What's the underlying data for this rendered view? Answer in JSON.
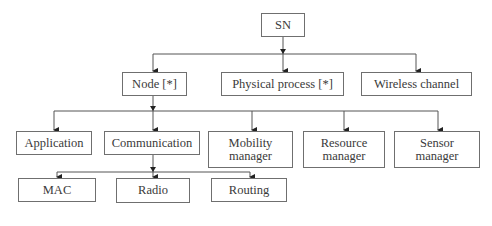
{
  "diagram": {
    "root": {
      "label": "SN"
    },
    "level1": [
      {
        "label": "Node [*]"
      },
      {
        "label": "Physical process [*]"
      },
      {
        "label": "Wireless channel"
      }
    ],
    "node_children": [
      {
        "label": "Application"
      },
      {
        "label": "Communication"
      },
      {
        "label_line1": "Mobility",
        "label_line2": "manager"
      },
      {
        "label_line1": "Resource",
        "label_line2": "manager"
      },
      {
        "label_line1": "Sensor",
        "label_line2": "manager"
      }
    ],
    "communication_children": [
      {
        "label": "MAC"
      },
      {
        "label": "Radio"
      },
      {
        "label": "Routing"
      }
    ],
    "edges": [
      [
        "SN",
        "Node [*]"
      ],
      [
        "SN",
        "Physical process [*]"
      ],
      [
        "SN",
        "Wireless channel"
      ],
      [
        "Node [*]",
        "Application"
      ],
      [
        "Node [*]",
        "Communication"
      ],
      [
        "Node [*]",
        "Mobility manager"
      ],
      [
        "Node [*]",
        "Resource manager"
      ],
      [
        "Node [*]",
        "Sensor manager"
      ],
      [
        "Communication",
        "MAC"
      ],
      [
        "Communication",
        "Radio"
      ],
      [
        "Communication",
        "Routing"
      ]
    ]
  }
}
